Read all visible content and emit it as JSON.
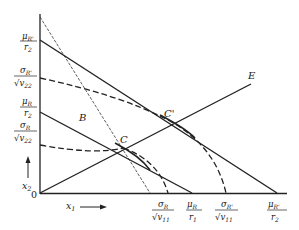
{
  "diagram": {
    "type": "portfolio-feasible-region",
    "origin_label": "0",
    "axis_x_label": "x",
    "axis_x_sub": "1",
    "axis_y_label": "x",
    "axis_y_sub": "2",
    "points": {
      "B": "B",
      "C": "C",
      "C_prime": "C'",
      "E": "E"
    },
    "y_axis_ticks": [
      {
        "num": "μ",
        "num_sub": "R'",
        "den": "r",
        "den_sub": "2"
      },
      {
        "num": "σ",
        "num_sub": "R'",
        "den": "√v",
        "den_sub": "22"
      },
      {
        "num": "μ",
        "num_sub": "R",
        "den": "r",
        "den_sub": "2"
      },
      {
        "num": "σ",
        "num_sub": "R",
        "den": "√v",
        "den_sub": "22"
      }
    ],
    "x_axis_ticks": [
      {
        "num": "σ",
        "num_sub": "R",
        "den": "√v",
        "den_sub": "11"
      },
      {
        "num": "μ",
        "num_sub": "R",
        "den": "r",
        "den_sub": "1"
      },
      {
        "num": "σ",
        "num_sub": "R'",
        "den": "√v",
        "den_sub": "11"
      },
      {
        "num": "μ",
        "num_sub": "R'",
        "den": "r",
        "den_sub": "2"
      }
    ]
  }
}
